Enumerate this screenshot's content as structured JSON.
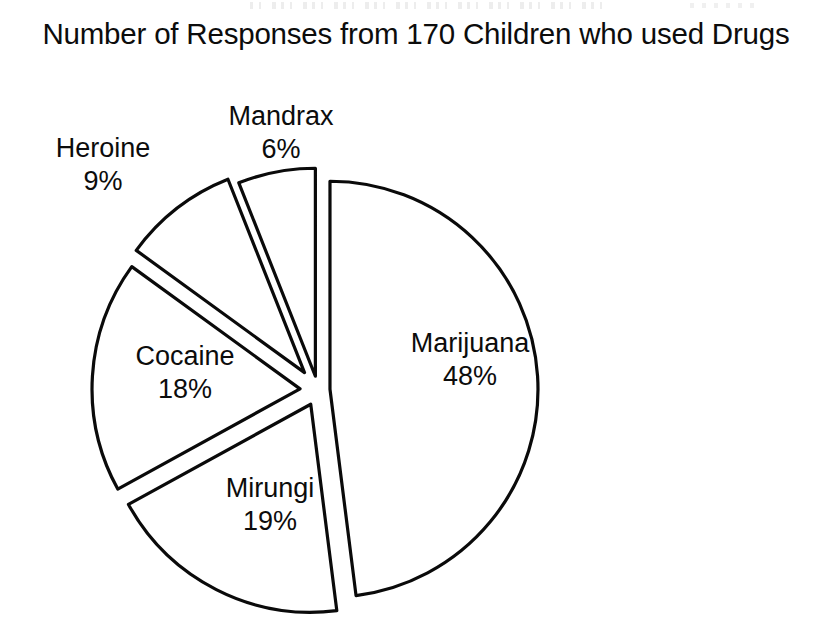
{
  "chart_data": {
    "type": "pie",
    "title": "Number of Responses from 170 Children who used Drugs",
    "title_line1": "Number of Responses from 170 Children who",
    "title_line2": "used Drugs",
    "total_respondents": 170,
    "units": "%",
    "legend": "none (slices labelled in place)",
    "exploded": true,
    "categories": [
      "Marijuana",
      "Mirungi",
      "Cocaine",
      "Heroine",
      "Mandrax"
    ],
    "values": [
      48,
      19,
      18,
      9,
      6
    ],
    "slices": [
      {
        "name": "Marijuana",
        "value": 48,
        "label": "Marijuana",
        "percent_label": "48%",
        "start_angle": -90,
        "end_angle": 82.8,
        "color": "#ffffff",
        "outline": "#0a0a0a"
      },
      {
        "name": "Mirungi",
        "value": 19,
        "label": "Mirungi",
        "percent_label": "19%",
        "start_angle": 82.8,
        "end_angle": 151.2,
        "color": "#ffffff",
        "outline": "#0a0a0a"
      },
      {
        "name": "Cocaine",
        "value": 18,
        "label": "Cocaine",
        "percent_label": "18%",
        "start_angle": 151.2,
        "end_angle": 216.0,
        "color": "#ffffff",
        "outline": "#0a0a0a"
      },
      {
        "name": "Heroine",
        "value": 9,
        "label": "Heroine",
        "percent_label": "9%",
        "start_angle": 216.0,
        "end_angle": 248.4,
        "color": "#ffffff",
        "outline": "#0a0a0a"
      },
      {
        "name": "Mandrax",
        "value": 6,
        "label": "Mandrax",
        "percent_label": "6%",
        "start_angle": 248.4,
        "end_angle": 270.0,
        "color": "#ffffff",
        "outline": "#0a0a0a"
      }
    ],
    "xlabel": "",
    "ylabel": "",
    "background": "#ffffff"
  },
  "geometry": {
    "center_x": 318,
    "center_y": 390,
    "radius": 208,
    "explode_offsets": {
      "Marijuana": 12,
      "Mirungi": 16,
      "Cocaine": 18,
      "Heroine": 22,
      "Mandrax": 14
    }
  }
}
